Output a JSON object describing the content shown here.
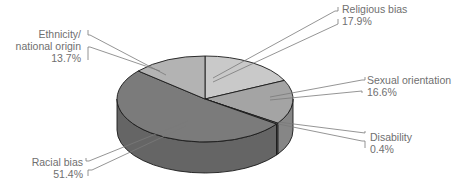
{
  "chart_data": {
    "type": "pie",
    "style": "3d-pie",
    "title": "",
    "slices": [
      {
        "label": "Religious bias",
        "value": 17.9,
        "display": "17.9%",
        "color": "#c9c9c9"
      },
      {
        "label": "Sexual orientation",
        "value": 16.6,
        "display": "16.6%",
        "color": "#a4a4a4"
      },
      {
        "label": "Disability",
        "value": 0.4,
        "display": "0.4%",
        "color": "#8a8a8a"
      },
      {
        "label": "Racial bias",
        "value": 51.4,
        "display": "51.4%",
        "color": "#7b7b7b"
      },
      {
        "label": "Ethnicity/ national origin",
        "value": 13.7,
        "display": "13.7%",
        "color": "#b3b3b3"
      }
    ],
    "legend": "none (callout labels)"
  },
  "labels": {
    "religious": {
      "name": "Religious bias",
      "pct": "17.9%"
    },
    "sexual": {
      "name": "Sexual orientation",
      "pct": "16.6%"
    },
    "disability": {
      "name": "Disability",
      "pct": "0.4%"
    },
    "racial": {
      "name": "Racial bias",
      "pct": "51.4%"
    },
    "ethnicity": {
      "name1": "Ethnicity/",
      "name2": "national origin",
      "pct": "13.7%"
    }
  }
}
